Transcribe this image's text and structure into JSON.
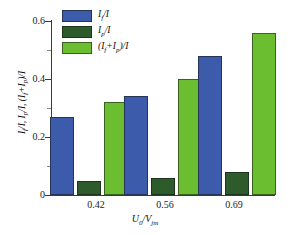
{
  "chart_data": {
    "type": "bar",
    "title": "",
    "xlabel": "U0/Vjm",
    "ylabel": "If/I, Ip/I, (If+Ip)/I",
    "categories": [
      "0.42",
      "0.56",
      "0.69"
    ],
    "series": [
      {
        "name": "If/I",
        "values": [
          0.27,
          0.34,
          0.48
        ],
        "color": "#3c5cab"
      },
      {
        "name": "Ip/I",
        "values": [
          0.05,
          0.06,
          0.08
        ],
        "color": "#2e5b2b"
      },
      {
        "name": "(If+Ip)/I",
        "values": [
          0.32,
          0.4,
          0.56
        ],
        "color": "#6cbe31"
      }
    ],
    "ylim": [
      0,
      0.6
    ],
    "yticks": [
      "0",
      "0.2",
      "0.4",
      "0.6"
    ],
    "ytick_values": [
      0,
      0.2,
      0.4,
      0.6
    ],
    "yminor_values": [
      0.1,
      0.3,
      0.5
    ],
    "grid": false,
    "legend_position": "top-left"
  },
  "axes": {
    "y_tick_labels": [
      "0.6",
      "0.4",
      "0.2",
      "0"
    ],
    "x_tick_labels": [
      "0.42",
      "0.56",
      "0.69"
    ],
    "x_axis_title_main": "U",
    "x_axis_title_sub": "0",
    "x_axis_title_slash": "/V",
    "x_axis_title_sub2": "jm",
    "y_axis_title": "I_f/I, I_p/I, (I_f+I_p)/I"
  },
  "legend": {
    "items": [
      {
        "label": "If/I",
        "base1": "I",
        "sub1": "f",
        "tail": "/I",
        "color": "#3c5cab"
      },
      {
        "label": "Ip/I",
        "base1": "I",
        "sub1": "p",
        "tail": "/I",
        "color": "#2e5b2b"
      },
      {
        "label": "(If+Ip)/I",
        "base1": "I",
        "sub1": "f",
        "tail": "/I",
        "color": "#6cbe31"
      }
    ]
  }
}
